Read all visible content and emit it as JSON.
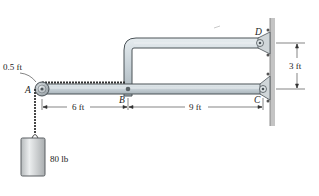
{
  "diagram": {
    "type": "statics-frame",
    "points": {
      "A": "A",
      "B": "B",
      "C": "C",
      "D": "D"
    },
    "dimensions": {
      "pulley_radius": "0.5 ft",
      "AB": "6 ft",
      "BC": "9 ft",
      "CD_vertical": "3 ft"
    },
    "load": {
      "weight": "80 lb"
    },
    "colors": {
      "member_fill": "#c9d4da",
      "member_stroke": "#4a5257",
      "wall": "#b8b8b8",
      "dim_line": "#333333"
    }
  }
}
